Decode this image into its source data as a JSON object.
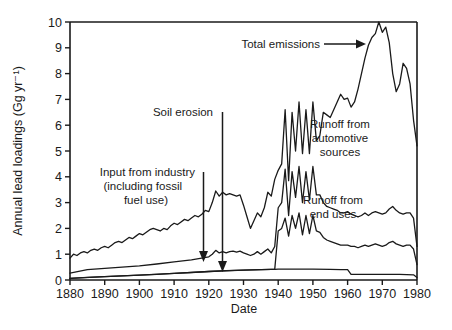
{
  "chart_data": {
    "type": "line",
    "title": "",
    "xlabel": "Date",
    "ylabel": "Annual lead loadings (Gg yr⁻¹)",
    "xlim": [
      1880,
      1980
    ],
    "ylim": [
      0,
      10
    ],
    "xticks": [
      1880,
      1890,
      1900,
      1910,
      1920,
      1930,
      1940,
      1950,
      1960,
      1970,
      1980
    ],
    "yticks": [
      0,
      1,
      2,
      3,
      4,
      5,
      6,
      7,
      8,
      9,
      10
    ],
    "grid": false,
    "legend_position": "inline-annotations",
    "annotations": [
      {
        "text": "Total emissions",
        "x": 1935,
        "y": 9.3,
        "arrow": true,
        "arrow_to_x": 1957,
        "arrow_to_y": 9.2
      },
      {
        "text": "Soil erosion",
        "x": 1905,
        "y": 6.5,
        "arrow": true,
        "arrow_to_x": 1924,
        "arrow_to_y": 0.35
      },
      {
        "text": "Input from industry (including fossil fuel use)",
        "x": 1897,
        "y": 4.1,
        "arrow": true,
        "arrow_to_x": 1920,
        "arrow_to_y": 0.72
      },
      {
        "text": "Runoff from automotive sources",
        "x": 1955,
        "y": 5.0,
        "arrow": false
      },
      {
        "text": "Runoff from end uses",
        "x": 1953,
        "y": 2.2,
        "arrow": false
      }
    ],
    "series": [
      {
        "name": "Total emissions",
        "x": [
          1880,
          1881,
          1882,
          1883,
          1884,
          1885,
          1886,
          1887,
          1888,
          1889,
          1890,
          1891,
          1892,
          1893,
          1894,
          1895,
          1896,
          1897,
          1898,
          1899,
          1900,
          1901,
          1902,
          1903,
          1904,
          1905,
          1906,
          1907,
          1908,
          1909,
          1910,
          1911,
          1912,
          1913,
          1914,
          1915,
          1916,
          1917,
          1918,
          1919,
          1920,
          1921,
          1922,
          1923,
          1924,
          1925,
          1926,
          1927,
          1928,
          1929,
          1930,
          1931,
          1932,
          1933,
          1934,
          1935,
          1936,
          1937,
          1938,
          1939,
          1940,
          1941,
          1942,
          1943,
          1944,
          1945,
          1946,
          1947,
          1948,
          1949,
          1950,
          1951,
          1952,
          1953,
          1954,
          1955,
          1956,
          1957,
          1958,
          1959,
          1960,
          1961,
          1962,
          1963,
          1964,
          1965,
          1966,
          1967,
          1968,
          1969,
          1970,
          1971,
          1972,
          1973,
          1974,
          1975,
          1976,
          1977,
          1978,
          1979,
          1980
        ],
        "y": [
          0.85,
          1.0,
          0.95,
          1.05,
          1.1,
          1.05,
          1.15,
          1.2,
          1.15,
          1.25,
          1.3,
          1.25,
          1.35,
          1.45,
          1.5,
          1.45,
          1.55,
          1.65,
          1.6,
          1.7,
          1.8,
          1.75,
          1.85,
          1.95,
          2.0,
          1.95,
          1.9,
          2.0,
          1.95,
          2.1,
          2.2,
          2.15,
          2.25,
          2.35,
          2.3,
          2.4,
          2.5,
          2.45,
          2.55,
          2.7,
          2.65,
          3.0,
          3.45,
          3.25,
          3.4,
          3.3,
          3.35,
          3.3,
          3.25,
          3.3,
          2.9,
          2.45,
          2.0,
          2.3,
          2.6,
          2.45,
          2.8,
          3.4,
          3.25,
          3.9,
          4.25,
          4.5,
          6.6,
          3.85,
          6.5,
          5.0,
          6.9,
          4.9,
          6.6,
          4.9,
          6.9,
          5.4,
          5.6,
          6.5,
          6.4,
          6.3,
          6.6,
          6.9,
          7.2,
          7.0,
          7.05,
          6.7,
          6.9,
          7.4,
          8.0,
          8.6,
          9.1,
          9.4,
          9.55,
          10.0,
          9.6,
          9.8,
          9.2,
          8.0,
          7.3,
          7.6,
          8.4,
          8.2,
          7.6,
          6.2,
          5.2
        ]
      },
      {
        "name": "Runoff from automotive sources (upper band)",
        "x": [
          1880,
          1885,
          1890,
          1895,
          1900,
          1905,
          1910,
          1915,
          1920,
          1921,
          1922,
          1923,
          1924,
          1925,
          1926,
          1927,
          1928,
          1929,
          1930,
          1931,
          1932,
          1933,
          1934,
          1935,
          1936,
          1937,
          1938,
          1939,
          1940,
          1941,
          1942,
          1943,
          1944,
          1945,
          1946,
          1947,
          1948,
          1949,
          1950,
          1951,
          1952,
          1953,
          1954,
          1955,
          1956,
          1957,
          1958,
          1959,
          1960,
          1961,
          1962,
          1963,
          1964,
          1965,
          1966,
          1967,
          1968,
          1969,
          1970,
          1971,
          1972,
          1973,
          1974,
          1975,
          1976,
          1977,
          1978,
          1979,
          1980
        ],
        "y": [
          0.27,
          0.4,
          0.45,
          0.5,
          0.55,
          0.62,
          0.7,
          0.78,
          0.9,
          1.0,
          1.15,
          1.05,
          1.1,
          1.05,
          1.1,
          1.12,
          1.08,
          1.12,
          1.05,
          1.0,
          0.95,
          1.0,
          1.1,
          1.0,
          1.1,
          1.2,
          1.05,
          1.3,
          2.8,
          3.0,
          4.3,
          2.5,
          4.2,
          3.2,
          4.4,
          3.0,
          4.2,
          3.1,
          4.4,
          3.3,
          3.3,
          3.0,
          2.85,
          2.8,
          2.75,
          2.7,
          2.6,
          2.6,
          2.65,
          2.55,
          2.5,
          2.45,
          2.5,
          2.6,
          2.5,
          2.6,
          2.65,
          2.6,
          2.55,
          2.6,
          2.75,
          2.85,
          2.7,
          2.6,
          2.55,
          2.6,
          2.6,
          2.4,
          1.3
        ]
      },
      {
        "name": "Runoff from end uses (lower band)",
        "x": [
          1880,
          1885,
          1890,
          1895,
          1900,
          1905,
          1910,
          1915,
          1920,
          1925,
          1930,
          1935,
          1938,
          1939,
          1940,
          1941,
          1942,
          1943,
          1944,
          1945,
          1946,
          1947,
          1948,
          1949,
          1950,
          1951,
          1952,
          1953,
          1954,
          1955,
          1956,
          1957,
          1958,
          1959,
          1960,
          1961,
          1962,
          1963,
          1964,
          1965,
          1966,
          1967,
          1968,
          1969,
          1970,
          1971,
          1972,
          1973,
          1974,
          1975,
          1976,
          1977,
          1978,
          1979,
          1980
        ],
        "y": [
          0.06,
          0.1,
          0.13,
          0.16,
          0.19,
          0.22,
          0.26,
          0.29,
          0.33,
          0.36,
          0.38,
          0.4,
          0.41,
          0.41,
          1.9,
          2.0,
          2.4,
          1.7,
          2.5,
          2.0,
          2.6,
          1.75,
          2.5,
          1.8,
          2.5,
          1.9,
          1.85,
          1.65,
          1.55,
          1.5,
          1.45,
          1.4,
          1.35,
          1.35,
          1.35,
          1.3,
          1.3,
          1.25,
          1.3,
          1.35,
          1.3,
          1.35,
          1.4,
          1.35,
          1.3,
          1.35,
          1.45,
          1.5,
          1.4,
          1.35,
          1.3,
          1.35,
          1.35,
          1.2,
          0.6
        ]
      },
      {
        "name": "Soil erosion (baseline)",
        "x": [
          1880,
          1890,
          1900,
          1910,
          1920,
          1930,
          1938,
          1939,
          1940,
          1950,
          1955,
          1958,
          1960,
          1961,
          1970,
          1975,
          1979,
          1980
        ],
        "y": [
          0.06,
          0.13,
          0.19,
          0.26,
          0.33,
          0.38,
          0.41,
          0.41,
          0.42,
          0.42,
          0.41,
          0.4,
          0.4,
          0.22,
          0.22,
          0.22,
          0.2,
          0.1
        ]
      }
    ]
  },
  "axis": {
    "y_title": "Annual lead loadings (Gg yr⁻¹)",
    "x_title": "Date"
  },
  "labels": {
    "total_emissions": "Total emissions",
    "soil_erosion": "Soil erosion",
    "input_industry_l1": "Input from industry",
    "input_industry_l2": "(including fossil",
    "input_industry_l3": "fuel use)",
    "runoff_auto_l1": "Runoff from",
    "runoff_auto_l2": "automotive",
    "runoff_auto_l3": "sources",
    "runoff_end_l1": "Runoff from",
    "runoff_end_l2": "end uses"
  }
}
